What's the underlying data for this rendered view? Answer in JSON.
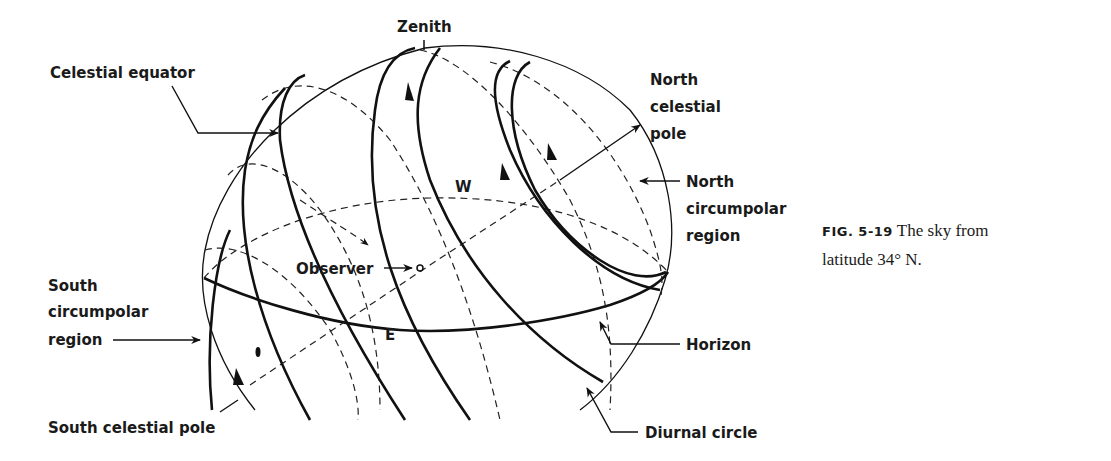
{
  "figure": {
    "title": "The sky from latitude 34° N.",
    "caption": {
      "number": "FIG. 5-19",
      "line1": "The sky from",
      "line2": "latitude 34° N."
    },
    "labels": {
      "zenith": "Zenith",
      "celestial_equator": "Celestial equator",
      "north_celestial_pole_1": "North",
      "north_celestial_pole_2": "celestial",
      "north_celestial_pole_3": "pole",
      "north_circumpolar_1": "North",
      "north_circumpolar_2": "circumpolar",
      "north_circumpolar_3": "region",
      "observer": "Observer",
      "west": "W",
      "east": "E",
      "south_circumpolar_1": "South",
      "south_circumpolar_2": "circumpolar",
      "south_circumpolar_3": "region",
      "horizon": "Horizon",
      "south_celestial_pole": "South celestial pole",
      "diurnal_circle": "Diurnal circle"
    },
    "colors": {
      "ink": "#111111",
      "background": "#ffffff"
    }
  }
}
